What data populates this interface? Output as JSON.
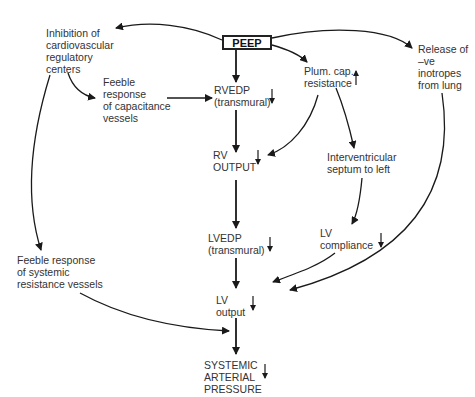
{
  "diagram": {
    "center_node": "PEEP",
    "nodes": {
      "inhibition": "Inhibition of\ncardiovascular\nregulatory\ncenters",
      "feeble_capacitance": "Feeble\nresponse\nof capacitance\nvessels",
      "rvedp": "RVEDP\n(transmural)",
      "plum_cap": "Plum. cap.\nresistance",
      "release_inotropes": "Release of\n–ve\ninotropes\nfrom lung",
      "rv_output": "RV\nOUTPUT",
      "interventricular": "Interventricular\nseptum to left",
      "lvedp": "LVEDP\n(transmural)",
      "lv_compliance": "LV\ncompliance",
      "feeble_systemic": "Feeble response\nof systemic\nresistance vessels",
      "lv_output": "LV\noutput",
      "systemic_pressure": "SYSTEMIC\nARTERIAL\nPRESSURE"
    },
    "indicators": {
      "rvedp": "down",
      "plum_cap": "up",
      "rv_output": "down",
      "lvedp": "down",
      "lv_compliance": "down",
      "lv_output": "down",
      "systemic_pressure": "down"
    },
    "colors": {
      "line": "#1a1a1a",
      "text": "#333333",
      "background": "#ffffff"
    }
  }
}
